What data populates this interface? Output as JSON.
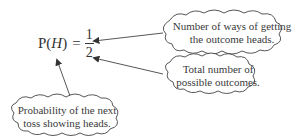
{
  "formula": {
    "lhs_prefix": "P(",
    "variable": "H",
    "lhs_suffix": ")",
    "equals": "=",
    "numerator": "1",
    "denominator": "2"
  },
  "callouts": [
    {
      "id": "numerator",
      "lines": [
        "Number of ways of getting",
        "the outcome heads."
      ]
    },
    {
      "id": "denominator",
      "lines": [
        "Total number of",
        "possible outcomes."
      ]
    },
    {
      "id": "probability",
      "lines": [
        "Probability of the next",
        "toss showing heads."
      ]
    }
  ],
  "colors": {
    "stroke": "#444444",
    "text": "#333333",
    "background": "#ffffff"
  }
}
